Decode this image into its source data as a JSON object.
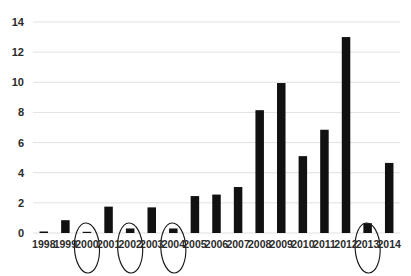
{
  "chart_data": {
    "type": "bar",
    "title": "",
    "subtitle": "",
    "xlabel": "",
    "ylabel": "",
    "categories": [
      "1998",
      "1999",
      "2000",
      "2001",
      "2002",
      "2003",
      "2004",
      "2005",
      "2006",
      "2007",
      "2008",
      "2009",
      "2010",
      "2011",
      "2012",
      "2013",
      "2014"
    ],
    "values": [
      0.1,
      0.85,
      0.05,
      1.75,
      0.3,
      1.7,
      0.3,
      2.45,
      2.55,
      3.05,
      8.15,
      9.95,
      5.1,
      6.85,
      13.0,
      0.65,
      4.65
    ],
    "ylim": [
      0,
      14
    ],
    "ytick_labels": [
      "0",
      "2",
      "4",
      "6",
      "8",
      "10",
      "12",
      "14"
    ],
    "ytick_values": [
      0,
      2,
      4,
      6,
      8,
      10,
      12,
      14
    ],
    "grid": true,
    "grid_axis": "y",
    "legend": null,
    "legend_position": "none",
    "bar_color": "#111111",
    "grid_color": "#d9d9d9",
    "text_color": "#2b2b2b",
    "annotations": [
      {
        "type": "ellipse",
        "label": "circled-2000",
        "category": "2000",
        "color": "#1a1a1a"
      },
      {
        "type": "ellipse",
        "label": "circled-2002",
        "category": "2002",
        "color": "#1a1a1a"
      },
      {
        "type": "ellipse",
        "label": "circled-2004",
        "category": "2004",
        "color": "#1a1a1a"
      },
      {
        "type": "ellipse",
        "label": "circled-2013",
        "category": "2013",
        "color": "#1a1a1a"
      }
    ]
  },
  "yticks": {
    "t0": "0",
    "t1": "2",
    "t2": "4",
    "t3": "6",
    "t4": "8",
    "t5": "10",
    "t6": "12",
    "t7": "14"
  },
  "xticks": {
    "x0": "1998",
    "x1": "1999",
    "x2": "2000",
    "x3": "2001",
    "x4": "2002",
    "x5": "2003",
    "x6": "2004",
    "x7": "2005",
    "x8": "2006",
    "x9": "2007",
    "x10": "2008",
    "x11": "2009",
    "x12": "2010",
    "x13": "2011",
    "x14": "2012",
    "x15": "2013",
    "x16": "2014"
  }
}
